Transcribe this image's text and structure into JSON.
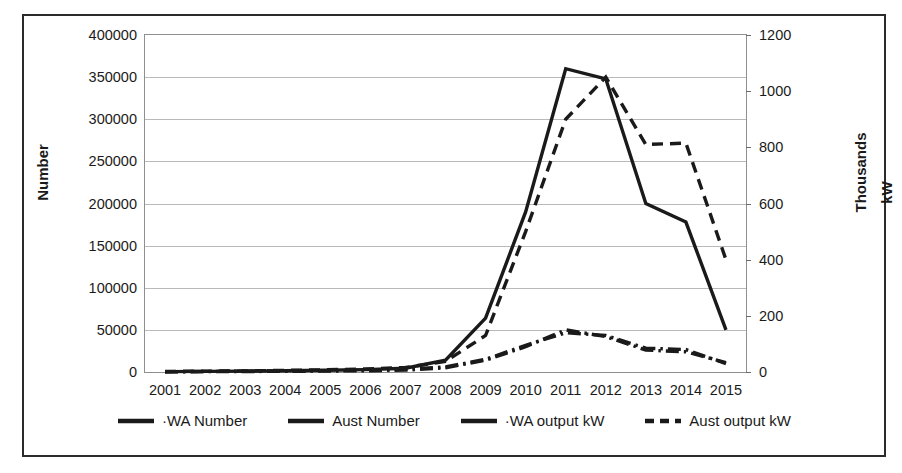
{
  "chart_data": {
    "type": "line",
    "title": "",
    "xlabel": "",
    "ylabel": "Number",
    "y2label": "Thousands kW",
    "y2label_line1": "Thousands",
    "y2label_line2": "kW",
    "grid": true,
    "legend_position": "bottom",
    "ylim": [
      0,
      400000
    ],
    "y2lim": [
      0,
      1200
    ],
    "yticks": [
      "0",
      "50000",
      "100000",
      "150000",
      "200000",
      "250000",
      "300000",
      "350000",
      "400000"
    ],
    "ytick_values": [
      0,
      50000,
      100000,
      150000,
      200000,
      250000,
      300000,
      350000,
      400000
    ],
    "y2ticks": [
      "0",
      "200",
      "400",
      "600",
      "800",
      "1000",
      "1200"
    ],
    "y2tick_values": [
      0,
      200,
      400,
      600,
      800,
      1000,
      1200
    ],
    "categories": [
      "2001",
      "2002",
      "2003",
      "2004",
      "2005",
      "2006",
      "2007",
      "2008",
      "2009",
      "2010",
      "2011",
      "2012",
      "2013",
      "2014",
      "2015"
    ],
    "x": [
      2001,
      2002,
      2003,
      2004,
      2005,
      2006,
      2007,
      2008,
      2009,
      2010,
      2011,
      2012,
      2013,
      2014,
      2015
    ],
    "series": [
      {
        "name": "·WA Number",
        "axis": "left",
        "style": "dash-dot",
        "values": [
          300,
          400,
          600,
          800,
          1100,
          1500,
          2200,
          5000,
          14000,
          30000,
          50000,
          42000,
          26000,
          24000,
          11000
        ]
      },
      {
        "name": "Aust Number",
        "axis": "left",
        "style": "solid",
        "values": [
          500,
          700,
          1000,
          1400,
          2000,
          2800,
          4500,
          14000,
          64000,
          190000,
          360000,
          348000,
          200000,
          178000,
          50000
        ]
      },
      {
        "name": "·WA output kW",
        "axis": "right",
        "style": "dash-dot",
        "values": [
          1,
          2,
          3,
          4,
          5,
          7,
          10,
          18,
          45,
          95,
          140,
          130,
          85,
          80,
          30
        ]
      },
      {
        "name": "Aust output kW",
        "axis": "right",
        "style": "dashed",
        "values": [
          2,
          3,
          4,
          6,
          8,
          11,
          16,
          38,
          130,
          500,
          900,
          1050,
          810,
          815,
          400
        ]
      }
    ],
    "legend": [
      {
        "label": "·WA Number",
        "style": "solid",
        "color": "#1a1a1a"
      },
      {
        "label": "Aust Number",
        "style": "solid",
        "color": "#1a1a1a"
      },
      {
        "label": "·WA output kW",
        "style": "solid",
        "color": "#1a1a1a"
      },
      {
        "label": "Aust output kW",
        "style": "dashed",
        "color": "#1a1a1a"
      }
    ],
    "colors": {
      "line": "#1a1a1a",
      "grid": "#b9b9b9",
      "frame": "#8f8f8f",
      "border": "#2b2b2b",
      "background": "#ffffff"
    }
  }
}
